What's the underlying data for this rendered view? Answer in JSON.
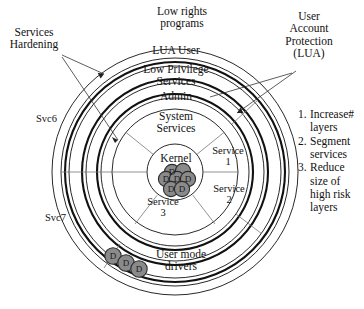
{
  "diagram": {
    "center": {
      "x": 175,
      "y": 172
    },
    "colors": {
      "ring_stroke": "#111111",
      "divider": "#777777",
      "driver_fill": "#8a8a8a",
      "background": "#ffffff"
    },
    "rings": [
      {
        "name": "outermost-boundary",
        "radius": 123,
        "weight": "thin"
      },
      {
        "name": "lua-user-ring",
        "radius": 110,
        "weight": "thick"
      },
      {
        "name": "low-privilege-services-ring",
        "radius": 93,
        "weight": "thick"
      },
      {
        "name": "admin-ring",
        "radius": 78,
        "weight": "thick"
      },
      {
        "name": "system-services-ring",
        "radius": 63,
        "weight": "thin"
      },
      {
        "name": "kernel-circle",
        "radius": 28,
        "weight": "thin"
      }
    ],
    "ring_labels": [
      {
        "id": "lua-user",
        "text": "LUA User"
      },
      {
        "id": "low-privilege-services",
        "text": "Low Privilege\nServices"
      },
      {
        "id": "admin",
        "text": "Admin"
      },
      {
        "id": "system-services",
        "text": "System\nServices"
      },
      {
        "id": "kernel",
        "text": "Kernel"
      }
    ],
    "segments": [
      {
        "id": "service-1",
        "text": "Service\n1"
      },
      {
        "id": "service-2",
        "text": "Service\n2"
      },
      {
        "id": "service-3",
        "text": "Service\n3"
      }
    ],
    "ring_annotations": [
      {
        "id": "svc6",
        "text": "Svc6"
      },
      {
        "id": "svc7",
        "text": "Svc7"
      },
      {
        "id": "user-mode-drivers",
        "text": "User mode\ndrivers"
      }
    ],
    "callouts": [
      {
        "id": "low-rights-programs",
        "text": "Low rights\nprograms"
      },
      {
        "id": "services-hardening",
        "text": "Services\nHardening"
      },
      {
        "id": "user-account-protection",
        "text": "User\nAccount\nProtection\n(LUA)"
      }
    ],
    "driver_glyph": "D",
    "kernel_drivers": [
      {
        "label": "D",
        "cx": 166,
        "cy": 178
      },
      {
        "label": "D",
        "cx": 176,
        "cy": 176
      },
      {
        "label": "D",
        "cx": 186,
        "cy": 179
      },
      {
        "label": "D",
        "cx": 172,
        "cy": 172
      },
      {
        "label": "D",
        "cx": 172,
        "cy": 187
      },
      {
        "label": "D",
        "cx": 183,
        "cy": 187
      }
    ],
    "user_mode_drivers": [
      {
        "label": "D",
        "cx": 113,
        "cy": 256
      },
      {
        "label": "D",
        "cx": 126,
        "cy": 263
      },
      {
        "label": "D",
        "cx": 138,
        "cy": 269
      }
    ]
  },
  "recommendations": {
    "items": [
      {
        "number": "1.",
        "text": "Increase#\nlayers"
      },
      {
        "number": "2.",
        "text": "Segment\nservices"
      },
      {
        "number": "3.",
        "text": "Reduce\nsize of\nhigh risk\nlayers"
      }
    ]
  }
}
